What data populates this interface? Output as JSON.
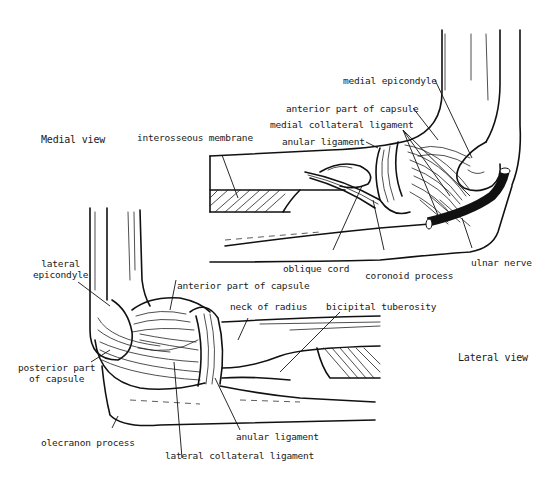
{
  "diagram": {
    "line_color": "#111111",
    "background": "#ffffff",
    "views": [
      {
        "id": "medial",
        "title": "Medial view",
        "labels": [
          {
            "key": "medial_epicondyle",
            "text": "medial epicondyle"
          },
          {
            "key": "anterior_capsule",
            "text": "anterior part of capsule"
          },
          {
            "key": "medial_collateral",
            "text": "medial collateral ligament"
          },
          {
            "key": "anular_ligament",
            "text": "anular ligament"
          },
          {
            "key": "interosseous_membrane",
            "text": "interosseous membrane"
          },
          {
            "key": "oblique_cord",
            "text": "oblique cord"
          },
          {
            "key": "coronoid_process",
            "text": "coronoid process"
          },
          {
            "key": "ulnar_nerve",
            "text": "ulnar nerve"
          }
        ]
      },
      {
        "id": "lateral",
        "title": "Lateral view",
        "labels": [
          {
            "key": "lateral_epicondyle",
            "text": "lateral\nepicondyle",
            "line1": "lateral",
            "line2": "epicondyle"
          },
          {
            "key": "anterior_capsule",
            "text": "anterior part of capsule"
          },
          {
            "key": "neck_of_radius",
            "text": "neck of radius"
          },
          {
            "key": "bicipital_tuberosity",
            "text": "bicipital tuberosity"
          },
          {
            "key": "posterior_capsule",
            "text": "posterior part\nof capsule",
            "line1": "posterior part",
            "line2": "of capsule"
          },
          {
            "key": "olecranon_process",
            "text": "olecranon process"
          },
          {
            "key": "anular_ligament",
            "text": "anular ligament"
          },
          {
            "key": "lateral_collateral",
            "text": "lateral collateral ligament"
          }
        ]
      }
    ]
  }
}
